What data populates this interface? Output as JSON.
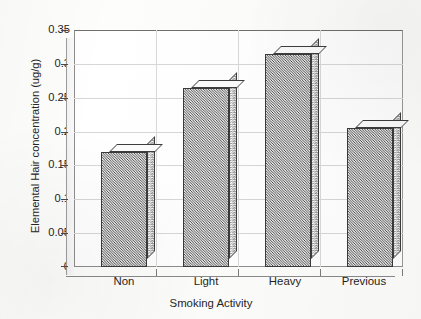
{
  "chart_data": {
    "type": "bar",
    "title": "",
    "subtitle": "",
    "categories": [
      "Non",
      "Light",
      "Heavy",
      "Previous"
    ],
    "values": [
      0.17,
      0.265,
      0.315,
      0.205
    ],
    "series": [
      {
        "name": "Elemental Hair concentration",
        "values": [
          0.17,
          0.265,
          0.315,
          0.205
        ]
      }
    ],
    "xlabel": "Smoking Activity",
    "ylabel": "Elemental Hair concentration (ug/g)",
    "ylim": [
      0,
      0.35
    ],
    "yticks": [
      0,
      0.05,
      0.1,
      0.15,
      0.2,
      0.25,
      0.3,
      0.35
    ],
    "ytick_labels": [
      "0",
      "0.05",
      "0.1",
      "0.15",
      "0.2",
      "0.25",
      "0.3",
      "0.35"
    ],
    "grid": true,
    "legend": false,
    "legend_position": "none",
    "bar_style": "3d-hatched",
    "colors": {
      "bar_fill": "#9e9e9e",
      "bar_outline": "#3a3a3a",
      "bar_top": "#fbfbfb",
      "bar_side": "#e2e2e2",
      "gridline": "#d7d7d7",
      "axis": "#8d8d8d",
      "text": "#1f1f1f",
      "background": "#fdfdfb"
    }
  }
}
